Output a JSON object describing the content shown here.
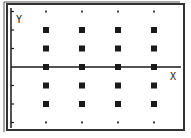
{
  "chart_data": {
    "type": "scatter",
    "title": "",
    "xlabel": "X",
    "ylabel": "Y",
    "grid": true,
    "grid_style": "dots",
    "x_ticks": [
      1,
      2,
      3,
      4
    ],
    "y_ticks": [
      -3,
      -2,
      -1,
      1,
      2,
      3
    ],
    "xlim": [
      0,
      4.7
    ],
    "ylim": [
      -3,
      3
    ],
    "series": [
      {
        "name": "plotted points",
        "marker": "square",
        "points": [
          {
            "x": 1,
            "y": 2
          },
          {
            "x": 2,
            "y": 2
          },
          {
            "x": 3,
            "y": 2
          },
          {
            "x": 4,
            "y": 2
          },
          {
            "x": 1,
            "y": 1
          },
          {
            "x": 2,
            "y": 1
          },
          {
            "x": 3,
            "y": 1
          },
          {
            "x": 4,
            "y": 1
          },
          {
            "x": 1,
            "y": 0
          },
          {
            "x": 2,
            "y": 0
          },
          {
            "x": 3,
            "y": 0
          },
          {
            "x": 4,
            "y": 0
          },
          {
            "x": 1,
            "y": -1
          },
          {
            "x": 2,
            "y": -1
          },
          {
            "x": 3,
            "y": -1
          },
          {
            "x": 4,
            "y": -1
          },
          {
            "x": 1,
            "y": -2
          },
          {
            "x": 2,
            "y": -2
          },
          {
            "x": 3,
            "y": -2
          },
          {
            "x": 4,
            "y": -2
          }
        ]
      }
    ],
    "grid_dots": [
      {
        "x": 1,
        "y": 3
      },
      {
        "x": 2,
        "y": 3
      },
      {
        "x": 3,
        "y": 3
      },
      {
        "x": 4,
        "y": 3
      },
      {
        "x": 1,
        "y": -3
      },
      {
        "x": 2,
        "y": -3
      },
      {
        "x": 3,
        "y": -3
      },
      {
        "x": 4,
        "y": -3
      }
    ]
  },
  "labels": {
    "x_axis": "X",
    "y_axis": "Y"
  },
  "colors": {
    "background": "#ffffff",
    "ink": "#1a1a1a",
    "border": "#333333"
  }
}
